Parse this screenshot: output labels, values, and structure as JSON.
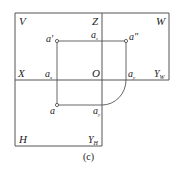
{
  "diagram": {
    "caption": "(c)",
    "quadrant_labels": {
      "V": "V",
      "W": "W",
      "H": "H",
      "X": "X",
      "Z": "Z",
      "O": "O",
      "Y_W": "Y",
      "Y_W_sub": "W",
      "Y_H": "Y",
      "Y_H_sub": "H"
    },
    "point_labels": {
      "a_prime": "a′",
      "a_double_prime": "a″",
      "a": "a",
      "a_x": "a",
      "a_x_sub": "x",
      "a_z": "a",
      "a_z_sub": "z",
      "a_yw": "a",
      "a_yw_sub": "y",
      "a_yh": "a",
      "a_yh_sub": "y"
    },
    "colors": {
      "line": "#555555",
      "text": "#222222"
    }
  }
}
